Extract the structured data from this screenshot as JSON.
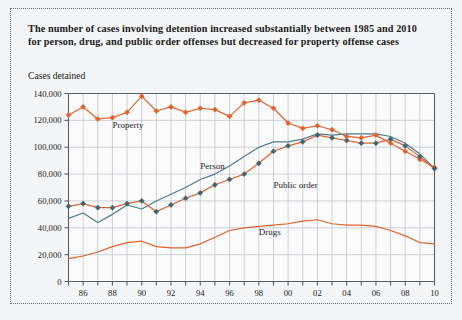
{
  "title": "The number of cases involving detention increased substantially between 1985 and 2010 for person, drug, and public order offenses but decreased for property offense cases",
  "subtitle": "Cases detained",
  "colors": {
    "orange": "#e0622c",
    "teal": "#4c7b8a",
    "marker_dark": "#3f6472",
    "grid": "#b9bfc6",
    "axis": "#5a5f66",
    "background": "#f4f5f7",
    "text": "#1a1a1a"
  },
  "series_labels": {
    "property": "Property",
    "person": "Person",
    "public_order": "Public order",
    "drugs": "Drugs"
  },
  "chart_data": {
    "type": "line",
    "title": "The number of cases involving detention increased substantially between 1985 and 2010 for person, drug, and public order offenses but decreased for property offense cases",
    "subtitle": "Cases detained",
    "xlabel": "",
    "ylabel": "Cases detained",
    "grid": true,
    "legend": "inline-labels",
    "xlim": [
      1985,
      2010
    ],
    "ylim": [
      0,
      140000
    ],
    "yticks": [
      0,
      20000,
      40000,
      60000,
      80000,
      100000,
      120000,
      140000
    ],
    "ytick_labels": [
      "0",
      "20,000",
      "40,000",
      "60,000",
      "80,000",
      "100,000",
      "120,000",
      "140,000"
    ],
    "x": [
      1985,
      1986,
      1987,
      1988,
      1989,
      1990,
      1991,
      1992,
      1993,
      1994,
      1995,
      1996,
      1997,
      1998,
      1999,
      2000,
      2001,
      2002,
      2003,
      2004,
      2005,
      2006,
      2007,
      2008,
      2009,
      2010
    ],
    "xtick_labels": [
      "",
      "86",
      "",
      "88",
      "",
      "90",
      "",
      "92",
      "",
      "94",
      "",
      "96",
      "",
      "98",
      "",
      "00",
      "",
      "02",
      "",
      "04",
      "",
      "06",
      "",
      "08",
      "",
      "10"
    ],
    "series": [
      {
        "name": "Property",
        "color": "#e0622c",
        "marker": "diamond",
        "marker_color": "#e0622c",
        "values": [
          124000,
          130000,
          121000,
          122000,
          126000,
          138000,
          127000,
          130000,
          126000,
          129000,
          128000,
          123000,
          133000,
          135000,
          129000,
          118000,
          114000,
          116000,
          113000,
          108000,
          107000,
          109000,
          103000,
          97000,
          91000,
          85000
        ]
      },
      {
        "name": "Person",
        "color": "#4c7b8a",
        "marker": "none",
        "values": [
          47000,
          51000,
          44000,
          50000,
          57000,
          54000,
          60000,
          65000,
          70000,
          76000,
          80000,
          86000,
          93000,
          100000,
          104000,
          104000,
          106000,
          110000,
          109000,
          110000,
          110000,
          110000,
          108000,
          103000,
          95000,
          84000
        ]
      },
      {
        "name": "Public order",
        "color": "#e0622c",
        "marker": "diamond",
        "marker_color": "#3f6472",
        "values": [
          56000,
          58000,
          55000,
          55000,
          58000,
          60000,
          52000,
          57000,
          62000,
          66000,
          72000,
          76000,
          80000,
          88000,
          97000,
          101000,
          104000,
          109000,
          107000,
          105000,
          103000,
          103000,
          106000,
          101000,
          93000,
          84000
        ]
      },
      {
        "name": "Drugs",
        "color": "#e0622c",
        "marker": "none",
        "values": [
          17000,
          19000,
          22000,
          26000,
          29000,
          30000,
          26000,
          25000,
          25000,
          28000,
          33000,
          38000,
          40000,
          41000,
          42000,
          43000,
          45000,
          46000,
          43000,
          42000,
          42000,
          41000,
          38000,
          34000,
          29000,
          28000
        ]
      }
    ],
    "annotations": [
      {
        "text": "Property",
        "x": 1988,
        "y": 114000
      },
      {
        "text": "Person",
        "x": 1994,
        "y": 84000
      },
      {
        "text": "Public order",
        "x": 1999,
        "y": 70000
      },
      {
        "text": "Drugs",
        "x": 1998,
        "y": 35000
      }
    ]
  }
}
